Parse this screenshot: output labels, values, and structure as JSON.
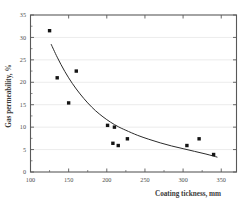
{
  "chart_data": {
    "type": "scatter",
    "title": "",
    "xlabel": "Coating tickness, mm",
    "ylabel": "Gas permeability, %",
    "xlim": [
      100,
      370
    ],
    "ylim": [
      0,
      35
    ],
    "xticks": [
      100,
      150,
      200,
      250,
      300,
      350
    ],
    "yticks": [
      0,
      5,
      10,
      15,
      20,
      25,
      30,
      35
    ],
    "xtick_labels": [
      "100",
      "150",
      "200",
      "250",
      "300",
      "350"
    ],
    "ytick_labels": [
      "0",
      "5",
      "10",
      "15",
      "20",
      "25",
      "30",
      "35"
    ],
    "grid": "horizontal",
    "legend": "none",
    "marker": "filled-square",
    "marker_color": "#141414",
    "curve_color": "#2b2b2b",
    "points": [
      {
        "x": 125,
        "y": 31.5
      },
      {
        "x": 135,
        "y": 21.0
      },
      {
        "x": 150,
        "y": 15.4
      },
      {
        "x": 160,
        "y": 22.5
      },
      {
        "x": 201,
        "y": 10.4
      },
      {
        "x": 210,
        "y": 10.0
      },
      {
        "x": 208,
        "y": 6.4
      },
      {
        "x": 215,
        "y": 5.9
      },
      {
        "x": 227,
        "y": 7.4
      },
      {
        "x": 305,
        "y": 5.9
      },
      {
        "x": 321,
        "y": 7.4
      },
      {
        "x": 340,
        "y": 3.9
      }
    ],
    "fit_curve": [
      {
        "x": 127,
        "y": 28.5
      },
      {
        "x": 135,
        "y": 25.6
      },
      {
        "x": 145,
        "y": 22.4
      },
      {
        "x": 155,
        "y": 19.7
      },
      {
        "x": 165,
        "y": 17.4
      },
      {
        "x": 175,
        "y": 15.4
      },
      {
        "x": 185,
        "y": 13.7
      },
      {
        "x": 195,
        "y": 12.3
      },
      {
        "x": 205,
        "y": 11.1
      },
      {
        "x": 215,
        "y": 10.1
      },
      {
        "x": 225,
        "y": 9.3
      },
      {
        "x": 240,
        "y": 8.2
      },
      {
        "x": 255,
        "y": 7.3
      },
      {
        "x": 270,
        "y": 6.5
      },
      {
        "x": 285,
        "y": 5.8
      },
      {
        "x": 300,
        "y": 5.2
      },
      {
        "x": 315,
        "y": 4.6
      },
      {
        "x": 330,
        "y": 4.0
      },
      {
        "x": 345,
        "y": 3.3
      }
    ]
  }
}
